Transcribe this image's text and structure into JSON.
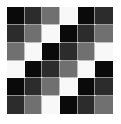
{
  "figure": {
    "background_color": "#ffffff",
    "rows": 6,
    "columns": 6,
    "palette": {
      "black": "#0a0a0a",
      "dark_gray": "#2c2c2c",
      "medium_gray": "#707070",
      "white": "#f8f8f8"
    },
    "tone_names": [
      "black",
      "dark_gray",
      "medium_gray",
      "white"
    ],
    "cells": [
      [
        "#0a0a0a",
        "#2c2c2c",
        "#707070",
        "#f8f8f8",
        "#0a0a0a",
        "#2c2c2c"
      ],
      [
        "#2c2c2c",
        "#707070",
        "#f8f8f8",
        "#0a0a0a",
        "#2c2c2c",
        "#707070"
      ],
      [
        "#707070",
        "#f8f8f8",
        "#0a0a0a",
        "#2c2c2c",
        "#707070",
        "#f8f8f8"
      ],
      [
        "#f8f8f8",
        "#0a0a0a",
        "#2c2c2c",
        "#707070",
        "#f8f8f8",
        "#0a0a0a"
      ],
      [
        "#0a0a0a",
        "#2c2c2c",
        "#707070",
        "#f8f8f8",
        "#0a0a0a",
        "#2c2c2c"
      ],
      [
        "#2c2c2c",
        "#707070",
        "#f8f8f8",
        "#0a0a0a",
        "#2c2c2c",
        "#707070"
      ]
    ],
    "cell_labels": [
      [
        "black",
        "dark_gray",
        "medium_gray",
        "white",
        "black",
        "dark_gray"
      ],
      [
        "dark_gray",
        "medium_gray",
        "white",
        "black",
        "dark_gray",
        "medium_gray"
      ],
      [
        "medium_gray",
        "white",
        "black",
        "dark_gray",
        "medium_gray",
        "white"
      ],
      [
        "white",
        "black",
        "dark_gray",
        "medium_gray",
        "white",
        "black"
      ],
      [
        "black",
        "dark_gray",
        "medium_gray",
        "white",
        "black",
        "dark_gray"
      ],
      [
        "dark_gray",
        "medium_gray",
        "white",
        "black",
        "dark_gray",
        "medium_gray"
      ]
    ]
  }
}
